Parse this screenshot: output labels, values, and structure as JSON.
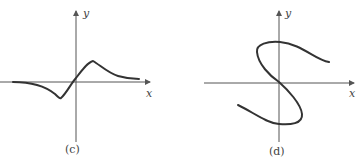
{
  "panels": [
    {
      "caption": "(c)",
      "x_label": "x",
      "y_label": "y",
      "description": "Odd function curve: approaches 0 from below on left, dips to a minimum left of origin, passes through origin, peaks right of origin, then decays toward 0"
    },
    {
      "caption": "(d)",
      "x_label": "x",
      "y_label": "y",
      "description": "S-shaped curve through the origin that is not a function (fails vertical line test)"
    }
  ]
}
